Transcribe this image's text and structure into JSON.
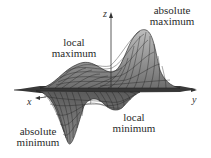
{
  "figure": {
    "axes": {
      "x_label": "x",
      "y_label": "y",
      "z_label": "z"
    },
    "annotations": {
      "absolute_maximum": {
        "line1": "absolute",
        "line2": "maximum"
      },
      "local_maximum": {
        "line1": "local",
        "line2": "maximum"
      },
      "local_minimum": {
        "line1": "local",
        "line2": "minimum"
      },
      "absolute_minimum": {
        "line1": "absolute",
        "line2": "minimum"
      }
    },
    "colors": {
      "mesh_line": "#1e1e1e",
      "surface_fill": "#9a9a9a",
      "surface_fill_light": "#c8c8c8",
      "axis": "#333333",
      "text": "#2a2a2a",
      "background": "#ffffff"
    }
  }
}
